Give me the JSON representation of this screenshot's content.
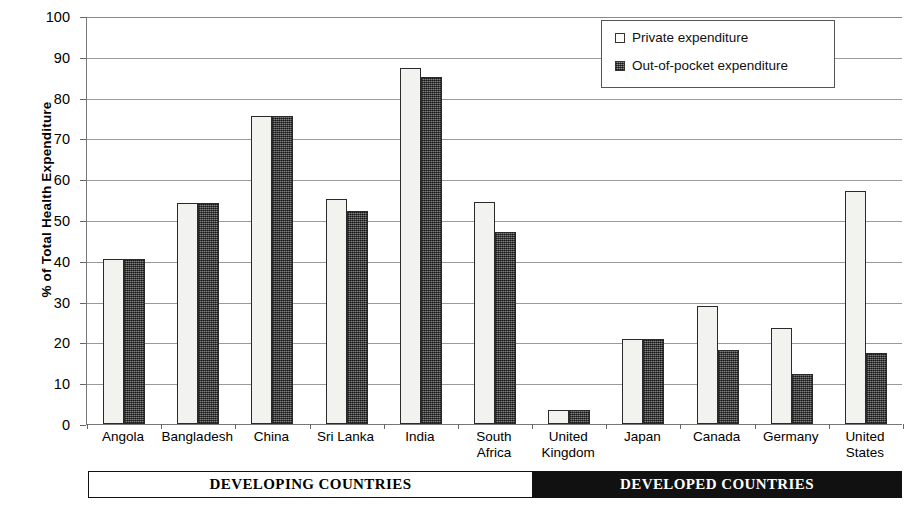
{
  "chart_data": {
    "type": "bar",
    "title": "",
    "xlabel": "",
    "ylabel": "% of Total Health Expenditure",
    "ylim": [
      0,
      100
    ],
    "ytick_step": 10,
    "yticks": [
      0,
      10,
      20,
      30,
      40,
      50,
      60,
      70,
      80,
      90,
      100
    ],
    "grid": true,
    "legend_position": "top-right",
    "categories": [
      "Angola",
      "Bangladesh",
      "China",
      "Sri Lanka",
      "India",
      "South Africa",
      "United Kingdom",
      "Japan",
      "Canada",
      "Germany",
      "United States"
    ],
    "category_lines": [
      [
        "Angola"
      ],
      [
        "Bangladesh"
      ],
      [
        "China"
      ],
      [
        "Sri Lanka"
      ],
      [
        "India"
      ],
      [
        "South",
        "Africa"
      ],
      [
        "United",
        "Kingdom"
      ],
      [
        "Japan"
      ],
      [
        "Canada"
      ],
      [
        "Germany"
      ],
      [
        "United",
        "States"
      ]
    ],
    "series": [
      {
        "name": "Private expenditure",
        "key": "private",
        "fill": "#f2f2ee",
        "values": [
          40.5,
          54.2,
          75.5,
          55.2,
          87.2,
          54.3,
          3.5,
          20.8,
          28.9,
          23.6,
          57.0
        ]
      },
      {
        "name": "Out-of-pocket expenditure",
        "key": "oop",
        "fill": "#4d4d4d",
        "values": [
          40.5,
          54.2,
          75.5,
          52.3,
          85.0,
          47.0,
          3.5,
          20.8,
          18.2,
          12.3,
          17.5
        ]
      }
    ]
  },
  "legend": {
    "items": [
      {
        "label": "Private expenditure",
        "swatch": "private"
      },
      {
        "label": "Out-of-pocket expenditure",
        "swatch": "oop"
      }
    ]
  },
  "banner": {
    "segments": [
      {
        "label": "DEVELOPING COUNTRIES",
        "style": "light",
        "span": 6
      },
      {
        "label": "DEVELOPED COUNTRIES",
        "style": "dark",
        "span": 5
      }
    ]
  },
  "colors": {
    "private_fill": "#f2f2ee",
    "oop_fill": "#4d4d4d",
    "bar_border": "#2a2a2a",
    "gridline": "#9a9a9a",
    "axis": "#777777",
    "banner_dark_bg": "#111111",
    "banner_light_bg": "#ffffff"
  }
}
